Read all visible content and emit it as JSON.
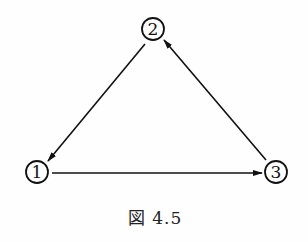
{
  "diagram": {
    "type": "directed-graph",
    "caption": "図 4.5",
    "nodes": [
      {
        "id": "1",
        "label": "1",
        "x": 37,
        "y": 172
      },
      {
        "id": "2",
        "label": "2",
        "x": 153,
        "y": 29
      },
      {
        "id": "3",
        "label": "3",
        "x": 276,
        "y": 172
      }
    ],
    "edges": [
      {
        "from": "2",
        "to": "1"
      },
      {
        "from": "1",
        "to": "3"
      },
      {
        "from": "3",
        "to": "2"
      }
    ],
    "colors": {
      "line": "#111111",
      "background": "#fefefe"
    }
  }
}
